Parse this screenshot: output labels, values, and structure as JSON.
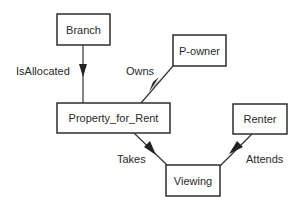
{
  "diagram": {
    "type": "entity-relationship",
    "entities": [
      {
        "id": "branch",
        "label": "Branch",
        "x": 57,
        "y": 14,
        "w": 53,
        "h": 31
      },
      {
        "id": "powner",
        "label": "P-owner",
        "x": 173,
        "y": 35,
        "w": 53,
        "h": 31
      },
      {
        "id": "pfr",
        "label": "Property_for_Rent",
        "x": 57,
        "y": 103,
        "w": 113,
        "h": 30
      },
      {
        "id": "renter",
        "label": "Renter",
        "x": 233,
        "y": 104,
        "w": 54,
        "h": 30
      },
      {
        "id": "viewing",
        "label": "Viewing",
        "x": 166,
        "y": 165,
        "w": 54,
        "h": 31
      }
    ],
    "relationships": [
      {
        "id": "isallocated",
        "label": "IsAllocated",
        "from": "Branch",
        "to": "Property_for_Rent"
      },
      {
        "id": "owns",
        "label": "Owns",
        "from": "P-owner",
        "to": "Property_for_Rent"
      },
      {
        "id": "takes",
        "label": "Takes",
        "from": "Property_for_Rent",
        "to": "Viewing"
      },
      {
        "id": "attends",
        "label": "Attends",
        "from": "Renter",
        "to": "Viewing"
      }
    ]
  }
}
